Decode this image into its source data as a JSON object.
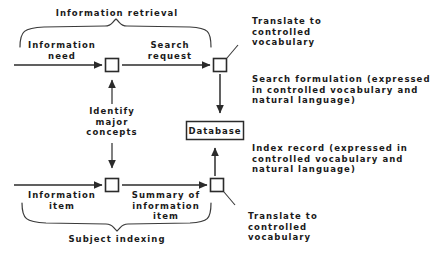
{
  "diagram": {
    "title_implicit": "Information retrieval and subject indexing process",
    "braces": {
      "top_label": "Information retrieval",
      "bottom_label": "Subject indexing"
    },
    "nodes": {
      "database": "Database",
      "process_boxes": [
        {
          "id": "ir-identify",
          "label": ""
        },
        {
          "id": "ir-translate",
          "label": ""
        },
        {
          "id": "si-identify",
          "label": ""
        },
        {
          "id": "si-translate",
          "label": ""
        }
      ]
    },
    "edges": {
      "information_need": "Information\nneed",
      "search_request": "Search\nrequest",
      "information_item": "Information\nitem",
      "summary_of_information_item": "Summary of\ninformation\nitem"
    },
    "annotations": {
      "identify_major_concepts": "Identify\nmajor\nconcepts",
      "translate_top": "Translate to\ncontrolled\nvocabulary",
      "translate_bottom": "Translate to\ncontrolled\nvocabulary",
      "search_formulation": "Search formulation (expressed\nin controlled vocabulary and\nnatural language)",
      "index_record": "Index record (expressed in\ncontrolled vocabulary and\nnatural language)"
    },
    "colors": {
      "background": "#ffffff",
      "stroke": "#2b2b2b",
      "text": "#1a1a1a"
    }
  }
}
